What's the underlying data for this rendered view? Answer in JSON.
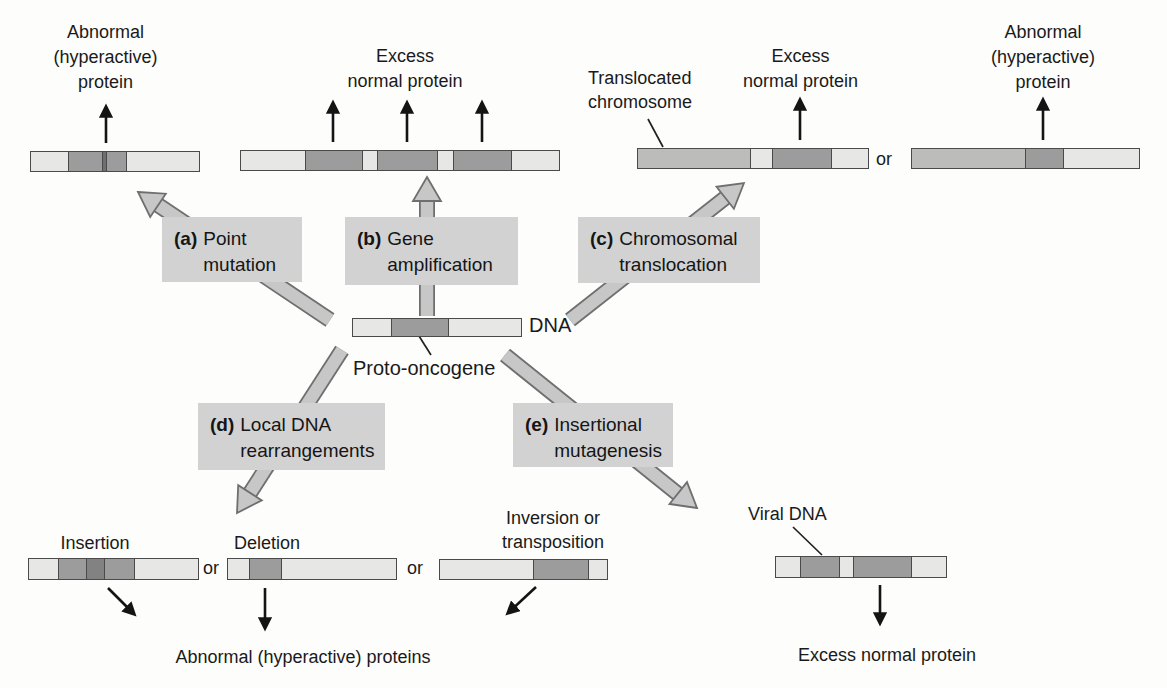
{
  "figure": {
    "description_domain": "proto-oncogene to oncogene conversion mechanisms diagram"
  },
  "labels": {
    "dna": "DNA",
    "proto_oncogene": "Proto-oncogene",
    "translocated_line1": "Translocated",
    "translocated_line2": "chromosome",
    "viral_dna": "Viral DNA",
    "insertion": "Insertion",
    "deletion": "Deletion",
    "inversion_line1": "Inversion or",
    "inversion_line2": "transposition",
    "or": "or"
  },
  "mechanisms": {
    "a": {
      "letter": "(a)",
      "line1": "Point",
      "line2": "mutation"
    },
    "b": {
      "letter": "(b)",
      "line1": "Gene",
      "line2": "amplification"
    },
    "c": {
      "letter": "(c)",
      "line1": "Chromosomal",
      "line2": "translocation"
    },
    "d": {
      "letter": "(d)",
      "line1": "Local DNA",
      "line2": "rearrangements"
    },
    "e": {
      "letter": "(e)",
      "line1": "Insertional",
      "line2": "mutagenesis"
    }
  },
  "outcomes": {
    "a": {
      "line1": "Abnormal",
      "line2": "(hyperactive)",
      "line3": "protein"
    },
    "b": {
      "line1": "Excess",
      "line2": "normal protein"
    },
    "c": {
      "line1": "Excess",
      "line2": "normal protein"
    },
    "c2": {
      "line1": "Abnormal",
      "line2": "(hyperactive)",
      "line3": "protein"
    },
    "d": "Abnormal (hyperactive) proteins",
    "e": "Excess normal protein"
  },
  "colors": {
    "bar_light": "#e7e7e6",
    "bar_dark": "#9c9c9c",
    "bar_medium": "#bcbcbb",
    "bar_insert": "#828282",
    "bar_mutation_line": "#6f6f6f",
    "bar_border": "#4a4a4a",
    "box_bg": "#d2d2d2",
    "gray_arrow_fill": "#c7c7c7",
    "gray_arrow_outline": "#6f6f6f",
    "text": "#1a1a1a",
    "background": "#fdfdfc"
  },
  "bars": {
    "point_mutated": {
      "segments": [
        {
          "c": "light",
          "w": 38
        },
        {
          "c": "dark",
          "w": 34
        },
        {
          "c": "mut",
          "w": 3
        },
        {
          "c": "dark",
          "w": 19
        },
        {
          "c": "light",
          "w": 74
        }
      ]
    },
    "amplified": {
      "segments": [
        {
          "c": "light",
          "w": 65
        },
        {
          "c": "dark",
          "w": 57
        },
        {
          "c": "light",
          "w": 15
        },
        {
          "c": "dark",
          "w": 60
        },
        {
          "c": "light",
          "w": 15
        },
        {
          "c": "dark",
          "w": 58
        },
        {
          "c": "light",
          "w": 48
        }
      ]
    },
    "translocated_1": {
      "segments": [
        {
          "c": "medium",
          "w": 113
        },
        {
          "c": "light",
          "w": 22
        },
        {
          "c": "dark",
          "w": 58
        },
        {
          "c": "light",
          "w": 37
        }
      ]
    },
    "translocated_2": {
      "segments": [
        {
          "c": "medium",
          "w": 114
        },
        {
          "c": "dark",
          "w": 37
        },
        {
          "c": "light",
          "w": 76
        }
      ]
    },
    "dna": {
      "segments": [
        {
          "c": "light",
          "w": 38
        },
        {
          "c": "dark",
          "w": 57
        },
        {
          "c": "light",
          "w": 73
        }
      ]
    },
    "insertion": {
      "segments": [
        {
          "c": "light",
          "w": 30
        },
        {
          "c": "dark",
          "w": 27
        },
        {
          "c": "insert",
          "w": 18
        },
        {
          "c": "dark",
          "w": 29
        },
        {
          "c": "light",
          "w": 65
        }
      ]
    },
    "deletion": {
      "segments": [
        {
          "c": "light",
          "w": 21
        },
        {
          "c": "dark",
          "w": 32
        },
        {
          "c": "light",
          "w": 115
        }
      ]
    },
    "inversion": {
      "segments": [
        {
          "c": "light",
          "w": 94
        },
        {
          "c": "dark",
          "w": 55
        },
        {
          "c": "light",
          "w": 18
        }
      ]
    },
    "viral": {
      "segments": [
        {
          "c": "light",
          "w": 25
        },
        {
          "c": "dark",
          "w": 38
        },
        {
          "c": "light",
          "w": 14
        },
        {
          "c": "dark",
          "w": 58
        },
        {
          "c": "light",
          "w": 35
        }
      ]
    }
  }
}
